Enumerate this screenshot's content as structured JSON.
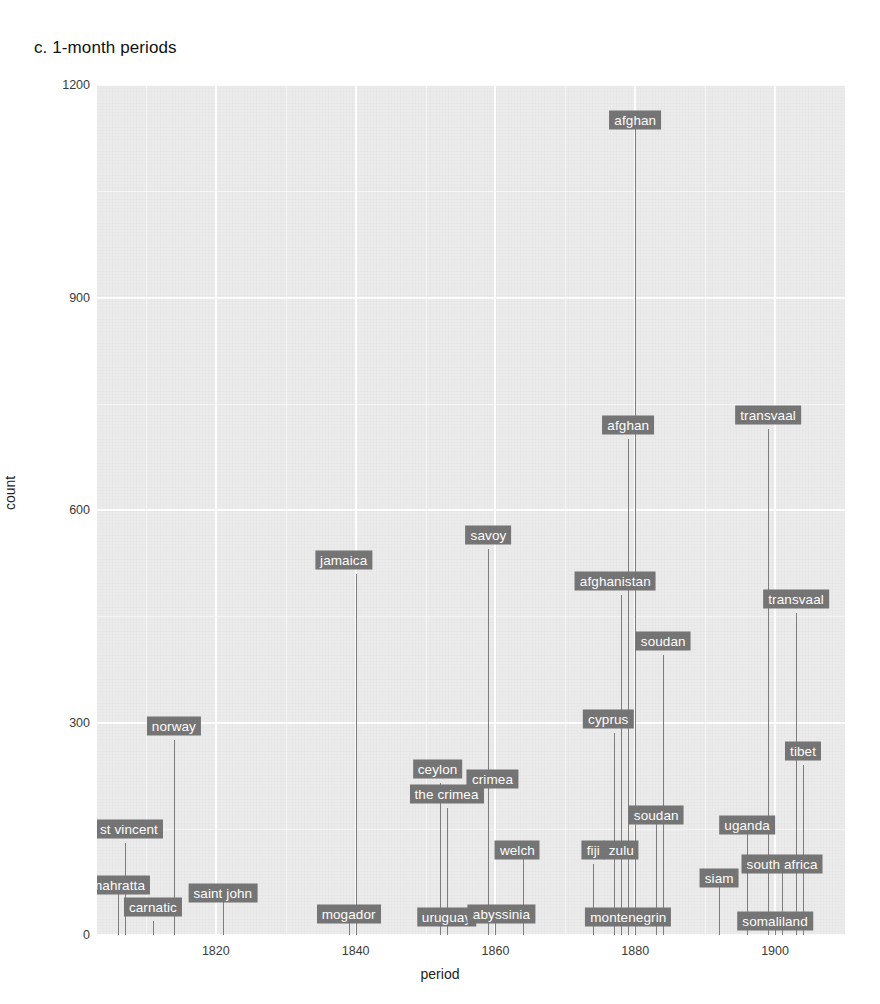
{
  "figure": {
    "title": "c. 1-month periods",
    "panel_bg": "#ebebeb",
    "grid_color": "#ffffff",
    "stem_color": "#7e7e7e",
    "label_bg": "#757575",
    "label_fg": "#ffffff"
  },
  "chart_data": {
    "type": "scatter",
    "title": "c. 1-month periods",
    "xlabel": "period",
    "ylabel": "count",
    "xlim": [
      1803,
      1910
    ],
    "ylim": [
      0,
      1200
    ],
    "xticks": [
      1820,
      1840,
      1860,
      1880,
      1900
    ],
    "yticks": [
      0,
      300,
      600,
      900,
      1200
    ],
    "xticks_minor": [
      1810,
      1830,
      1850,
      1870,
      1890,
      1910
    ],
    "yticks_minor": [
      150,
      450,
      750,
      1050
    ],
    "grid": true,
    "legend": null,
    "note": "Lollipop / stem plot: each point is a war-name term with a vertical stem dropping to y=0 and a labelled text box.",
    "points": [
      {
        "label": "mahratta",
        "x": 1806,
        "y": 70
      },
      {
        "label": "st vincent",
        "x": 1807,
        "y": 130
      },
      {
        "label": "carnatic",
        "x": 1811,
        "y": 20
      },
      {
        "label": "norway",
        "x": 1814,
        "y": 275
      },
      {
        "label": "saint john",
        "x": 1821,
        "y": 60
      },
      {
        "label": "mogador",
        "x": 1839,
        "y": 30
      },
      {
        "label": "jamaica",
        "x": 1840,
        "y": 510
      },
      {
        "label": "ceylon",
        "x": 1852,
        "y": 215
      },
      {
        "label": "uruguay",
        "x": 1853,
        "y": 5
      },
      {
        "label": "the crimea",
        "x": 1853,
        "y": 180
      },
      {
        "label": "savoy",
        "x": 1859,
        "y": 545
      },
      {
        "label": "crimea",
        "x": 1859,
        "y": 200
      },
      {
        "label": "abyssinia",
        "x": 1860,
        "y": 30
      },
      {
        "label": "welch",
        "x": 1864,
        "y": 120
      },
      {
        "label": "fiji",
        "x": 1874,
        "y": 100
      },
      {
        "label": "cyprus",
        "x": 1877,
        "y": 285
      },
      {
        "label": "afghanistan",
        "x": 1878,
        "y": 480
      },
      {
        "label": "zulu",
        "x": 1878,
        "y": 120
      },
      {
        "label": "afghan",
        "x": 1879,
        "y": 700
      },
      {
        "label": "montenegrin",
        "x": 1879,
        "y": 25
      },
      {
        "label": "afghan",
        "x": 1880,
        "y": 1150
      },
      {
        "label": "soudan",
        "x": 1883,
        "y": 170
      },
      {
        "label": "soudan",
        "x": 1884,
        "y": 395
      },
      {
        "label": "siam",
        "x": 1892,
        "y": 80
      },
      {
        "label": "uganda",
        "x": 1896,
        "y": 155
      },
      {
        "label": "transvaal",
        "x": 1899,
        "y": 715
      },
      {
        "label": "somaliland",
        "x": 1900,
        "y": 20
      },
      {
        "label": "south africa",
        "x": 1901,
        "y": 100
      },
      {
        "label": "transvaal",
        "x": 1903,
        "y": 455
      },
      {
        "label": "tibet",
        "x": 1904,
        "y": 240
      }
    ]
  },
  "axes": {
    "ylabel": "count",
    "xlabel": "period",
    "ytick_labels": [
      "0",
      "300",
      "600",
      "900",
      "1200"
    ],
    "xtick_labels": [
      "1820",
      "1840",
      "1860",
      "1880",
      "1900"
    ]
  },
  "labels": {
    "placements": [
      {
        "text": "norway",
        "x": 1814,
        "y": 275,
        "dx": 0,
        "dy": -14
      },
      {
        "text": "st vincent",
        "x": 1807,
        "y": 130,
        "dx": 4,
        "dy": -14
      },
      {
        "text": "mahratta",
        "x": 1806,
        "y": 70,
        "dx": 0,
        "dy": 0
      },
      {
        "text": "saint john",
        "x": 1821,
        "y": 60,
        "dx": 0,
        "dy": 0
      },
      {
        "text": "carnatic",
        "x": 1811,
        "y": 20,
        "dx": 0,
        "dy": -14
      },
      {
        "text": "jamaica",
        "x": 1840,
        "y": 510,
        "dx": -12,
        "dy": -14
      },
      {
        "text": "mogador",
        "x": 1839,
        "y": 30,
        "dx": 0,
        "dy": 0
      },
      {
        "text": "ceylon",
        "x": 1852,
        "y": 215,
        "dx": -2,
        "dy": -14
      },
      {
        "text": "the crimea",
        "x": 1853,
        "y": 180,
        "dx": 0,
        "dy": -14
      },
      {
        "text": "uruguay",
        "x": 1853,
        "y": 5,
        "dx": 0,
        "dy": -14
      },
      {
        "text": "savoy",
        "x": 1859,
        "y": 545,
        "dx": 0,
        "dy": -14
      },
      {
        "text": "crimea",
        "x": 1859,
        "y": 200,
        "dx": 4,
        "dy": -14
      },
      {
        "text": "abyssinia",
        "x": 1860,
        "y": 30,
        "dx": 6,
        "dy": 0
      },
      {
        "text": "welch",
        "x": 1864,
        "y": 120,
        "dx": -6,
        "dy": 0
      },
      {
        "text": "fiji",
        "x": 1874,
        "y": 100,
        "dx": 0,
        "dy": -14
      },
      {
        "text": "cyprus",
        "x": 1877,
        "y": 285,
        "dx": -6,
        "dy": -14
      },
      {
        "text": "afghanistan",
        "x": 1878,
        "y": 480,
        "dx": -6,
        "dy": -14
      },
      {
        "text": "zulu",
        "x": 1878,
        "y": 120,
        "dx": 0,
        "dy": 0
      },
      {
        "text": "afghan",
        "x": 1879,
        "y": 700,
        "dx": 0,
        "dy": -14
      },
      {
        "text": "montenegrin",
        "x": 1879,
        "y": 25,
        "dx": 0,
        "dy": 0
      },
      {
        "text": "afghan",
        "x": 1880,
        "y": 1150,
        "dx": 0,
        "dy": 0
      },
      {
        "text": "soudan",
        "x": 1883,
        "y": 170,
        "dx": 0,
        "dy": 0
      },
      {
        "text": "soudan",
        "x": 1884,
        "y": 395,
        "dx": 0,
        "dy": -14
      },
      {
        "text": "siam",
        "x": 1892,
        "y": 80,
        "dx": 0,
        "dy": 0
      },
      {
        "text": "uganda",
        "x": 1896,
        "y": 155,
        "dx": 0,
        "dy": 0
      },
      {
        "text": "transvaal",
        "x": 1899,
        "y": 715,
        "dx": 0,
        "dy": -14
      },
      {
        "text": "somaliland",
        "x": 1900,
        "y": 20,
        "dx": 0,
        "dy": 0
      },
      {
        "text": "south africa",
        "x": 1901,
        "y": 100,
        "dx": 0,
        "dy": 0
      },
      {
        "text": "transvaal",
        "x": 1903,
        "y": 455,
        "dx": 0,
        "dy": -14
      },
      {
        "text": "tibet",
        "x": 1904,
        "y": 240,
        "dx": 0,
        "dy": -14
      }
    ]
  }
}
